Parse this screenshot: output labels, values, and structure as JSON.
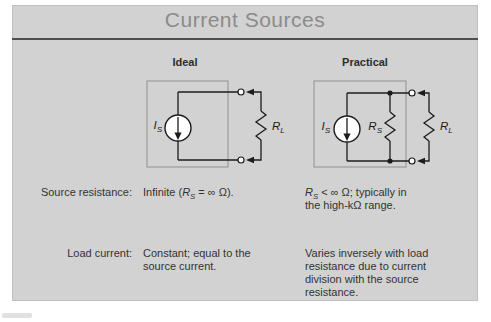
{
  "slide": {
    "title": "Current Sources"
  },
  "columns": {
    "ideal": "Ideal",
    "practical": "Practical"
  },
  "labels": {
    "is": {
      "main": "I",
      "sub": "S"
    },
    "rs": {
      "main": "R",
      "sub": "S"
    },
    "rl": {
      "main": "R",
      "sub": "L"
    }
  },
  "rows": [
    {
      "label": "Source resistance:",
      "ideal": [
        {
          "t": "Infinite ("
        },
        {
          "t": "R",
          "s": "i"
        },
        {
          "t": "S",
          "s": "sub"
        },
        {
          "t": " = ∞ Ω)."
        }
      ],
      "practical": [
        {
          "t": "R",
          "s": "i"
        },
        {
          "t": "S",
          "s": "sub"
        },
        {
          "t": " < ∞ Ω; typically in"
        },
        {
          "br": true
        },
        {
          "t": "the high-kΩ range."
        }
      ]
    },
    {
      "label": "Load current:",
      "ideal": [
        {
          "t": "Constant; equal to the"
        },
        {
          "br": true
        },
        {
          "t": "source current."
        }
      ],
      "practical": [
        {
          "t": "Varies inversely with load"
        },
        {
          "br": true
        },
        {
          "t": "resistance due to current"
        },
        {
          "br": true
        },
        {
          "t": "division with the source"
        },
        {
          "br": true
        },
        {
          "t": "resistance."
        }
      ]
    }
  ],
  "colors": {
    "page_bg": "#ffffff",
    "slide_bg": "#d2d2d2",
    "slide_border": "#c0c0c0",
    "title_color": "#8b8b8b",
    "rule_color": "#4f4f4f",
    "heading_color": "#2d2d2d",
    "text_color": "#333333",
    "line_color": "#1c1c1c",
    "box_color": "#909090"
  }
}
